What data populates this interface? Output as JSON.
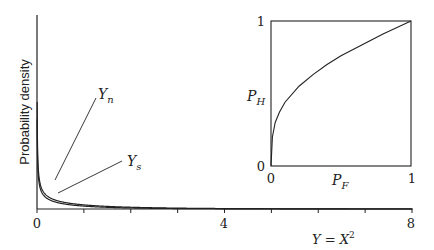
{
  "chart_data": [
    {
      "type": "line",
      "title": "",
      "ylabel": "Probability density",
      "xlabel": "Y = X²",
      "xlim": [
        0,
        8
      ],
      "xticks": [
        0,
        1,
        2,
        3,
        4,
        5,
        6,
        7,
        8
      ],
      "xtick_labels": [
        {
          "x": 0,
          "label": "0"
        },
        {
          "x": 4,
          "label": "4"
        },
        {
          "x": 8,
          "label": "8"
        }
      ],
      "grid": false,
      "series": [
        {
          "name": "Y_n",
          "label_main": "Y",
          "label_sub": "n",
          "description": "chi-square 1 dof (noise)",
          "scale": 1.0
        },
        {
          "name": "Y_s",
          "label_main": "Y",
          "label_sub": "s",
          "description": "signal + noise",
          "scale": 0.8
        }
      ],
      "annotations": [
        {
          "text": "Y_n",
          "points_to": "Y_n",
          "at_x": 0.45
        },
        {
          "text": "Y_s",
          "points_to": "Y_s",
          "at_x": 0.55
        }
      ]
    },
    {
      "type": "line",
      "title": "",
      "xlabel": "P_F",
      "ylabel": "P_H",
      "xlim": [
        0,
        1
      ],
      "ylim": [
        0,
        1
      ],
      "xtick_labels": [
        "0",
        "1"
      ],
      "ytick_labels": [
        "0",
        "1"
      ],
      "series": [
        {
          "name": "ROC",
          "x": [
            0,
            0.01,
            0.03,
            0.06,
            0.1,
            0.2,
            0.3,
            0.4,
            0.5,
            0.6,
            0.7,
            0.8,
            0.9,
            1.0
          ],
          "y": [
            0,
            0.2,
            0.3,
            0.37,
            0.44,
            0.55,
            0.63,
            0.7,
            0.76,
            0.81,
            0.86,
            0.91,
            0.955,
            1.0
          ]
        }
      ]
    }
  ],
  "labels": {
    "ylabel": "Probability density",
    "xlabel_main": "Y = X",
    "xlabel_sup": "2",
    "yn_main": "Y",
    "yn_sub": "n",
    "ys_main": "Y",
    "ys_sub": "s",
    "inset_xlabel_main": "P",
    "inset_xlabel_sub": "F",
    "inset_ylabel_main": "P",
    "inset_ylabel_sub": "H",
    "inset_x0": "0",
    "inset_x1": "1",
    "inset_y0": "0",
    "inset_y1": "1",
    "x0": "0",
    "x4": "4",
    "x8": "8"
  }
}
